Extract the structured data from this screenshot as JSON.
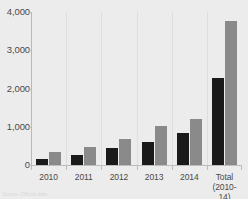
{
  "chart_data": {
    "type": "bar",
    "title": "",
    "subtitle": "",
    "xlabel": "",
    "ylabel": "",
    "ylim": [
      0,
      4000
    ],
    "yticks": [
      0,
      1000,
      2000,
      3000,
      4000
    ],
    "ytick_labels": [
      "0",
      "1,000",
      "2,000",
      "3,000",
      "4,000"
    ],
    "grid": false,
    "legend": "none",
    "categories": [
      "2010",
      "2011",
      "2012",
      "2013",
      "2014",
      "Total"
    ],
    "category_sublabels": [
      "",
      "",
      "",
      "",
      "",
      "(2010-14)"
    ],
    "series": [
      {
        "name": "series-1",
        "color": "#1a1a1a",
        "values": [
          150,
          250,
          440,
          610,
          830,
          2270
        ]
      },
      {
        "name": "series-2",
        "color": "#8a8a8a",
        "values": [
          330,
          460,
          690,
          1010,
          1210,
          3760
        ]
      }
    ]
  },
  "footnote": {
    "text": "Source: Official data"
  },
  "colors": {
    "background": "#ececec",
    "axis": "#bdbdbd",
    "separator": "#dedede",
    "text": "#4a4a4a",
    "series_1": "#1a1a1a",
    "series_2": "#8a8a8a"
  }
}
